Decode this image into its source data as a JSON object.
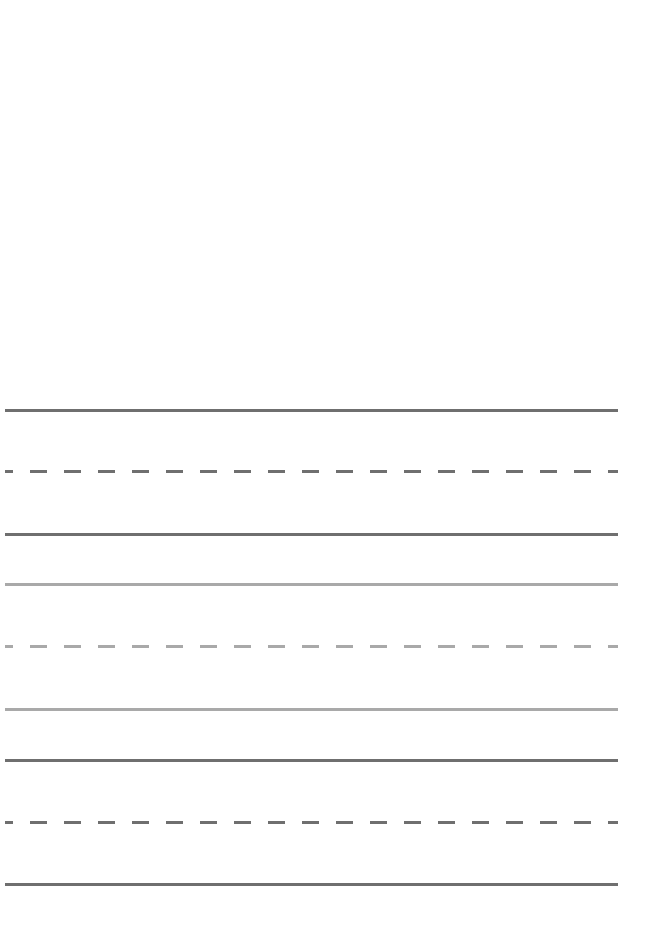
{
  "sheet": {
    "type": "handwriting practice lines",
    "groups": [
      {
        "color": "#6f6f6f",
        "top": 409,
        "mid": 470,
        "bottom": 533
      },
      {
        "color": "#a9a9a9",
        "top": 583,
        "mid": 645,
        "bottom": 708
      },
      {
        "color": "#6f6f6f",
        "top": 759,
        "mid": 821,
        "bottom": 883
      }
    ],
    "line_left": 5,
    "line_right": 618,
    "dash_length": 17,
    "dash_period": 34,
    "dash_phase": 13
  }
}
